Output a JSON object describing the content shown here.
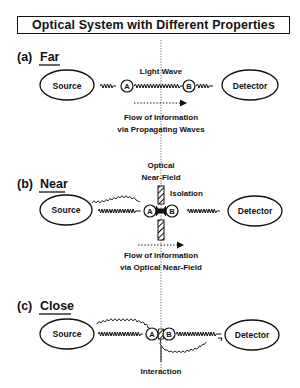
{
  "title": "Optical System with Different Properties",
  "colors": {
    "ink": "#111111",
    "background": "#ffffff"
  },
  "panels": [
    {
      "id": "a",
      "label_prefix": "(a)",
      "label": "Far",
      "source_label": "Source",
      "detector_label": "Detector",
      "node_a": "A",
      "node_b": "B",
      "wave_label": "Light Wave",
      "flow_line1": "Flow of Information",
      "flow_line2": "via Propagating Waves"
    },
    {
      "id": "b",
      "label_prefix": "(b)",
      "label": "Near",
      "source_label": "Source",
      "detector_label": "Detector",
      "node_a": "A",
      "node_b": "B",
      "field_line1": "Optical",
      "field_line2": "Near-Field",
      "isolation_label": "Isolation",
      "flow_line1": "Flow of Information",
      "flow_line2": "via Optical Near-Field"
    },
    {
      "id": "c",
      "label_prefix": "(c)",
      "label": "Close",
      "source_label": "Source",
      "detector_label": "Detector",
      "node_a": "A",
      "node_b": "B",
      "interaction_label": "Interaction"
    }
  ]
}
